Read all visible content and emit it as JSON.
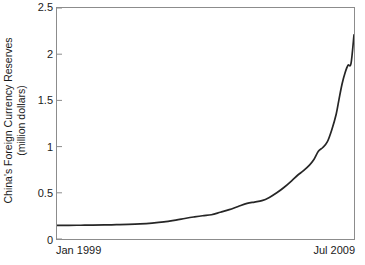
{
  "chart_data": {
    "type": "line",
    "title": "",
    "xlabel": "",
    "ylabel": "China's Foreign Currency Reserves (million dollars)",
    "ylabel_line1": "China's Foreign Currency Reserves",
    "ylabel_line2": "(million dollars)",
    "ylim": [
      0,
      2.5
    ],
    "yticks": [
      0,
      0.5,
      1,
      1.5,
      2,
      2.5
    ],
    "ytick_labels": [
      "0",
      "0.5",
      "1",
      "1.5",
      "2",
      "2.5"
    ],
    "xlim_labels": [
      "Jan 1999",
      "Jul 2009"
    ],
    "xticks": [],
    "grid": false,
    "legend": false,
    "line_color": "#262626",
    "frame_color": "#8c8c8c",
    "background": "#ffffff",
    "x_start": "Jan 1999",
    "x_end": "Jul 2009",
    "series": [
      {
        "name": "China's Foreign Currency Reserves",
        "x": [
          0,
          0.04,
          0.08,
          0.12,
          0.16,
          0.2,
          0.24,
          0.28,
          0.32,
          0.36,
          0.4,
          0.43,
          0.46,
          0.49,
          0.52,
          0.55,
          0.58,
          0.61,
          0.64,
          0.665,
          0.69,
          0.715,
          0.74,
          0.765,
          0.79,
          0.81,
          0.83,
          0.85,
          0.865,
          0.88,
          0.895,
          0.91,
          0.925,
          0.94,
          0.95,
          0.96,
          0.97,
          0.98,
          0.99,
          1
        ],
        "y": [
          0.148,
          0.148,
          0.149,
          0.15,
          0.152,
          0.155,
          0.158,
          0.163,
          0.172,
          0.185,
          0.205,
          0.222,
          0.238,
          0.252,
          0.262,
          0.29,
          0.318,
          0.352,
          0.385,
          0.4,
          0.415,
          0.45,
          0.5,
          0.56,
          0.63,
          0.69,
          0.74,
          0.8,
          0.86,
          0.95,
          0.99,
          1.05,
          1.18,
          1.35,
          1.52,
          1.68,
          1.8,
          1.88,
          1.9,
          2.21
        ],
        "y_start": 0.15,
        "y_end": 2.21,
        "y_max": 2.21,
        "y_min": 0.148
      }
    ],
    "annotations": []
  }
}
